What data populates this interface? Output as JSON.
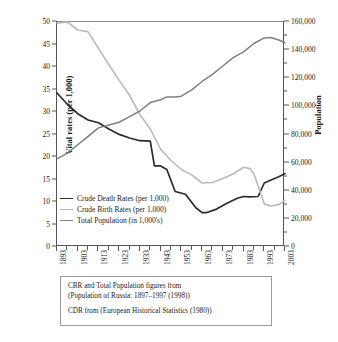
{
  "title": "",
  "chart_data": {
    "type": "line",
    "title": "",
    "xlabel": "",
    "ylabel": "Vital rates (per 1,000)",
    "y2label": "Population",
    "xlim": [
      1893,
      2003
    ],
    "ylim": [
      0,
      50
    ],
    "y2lim": [
      0,
      160000
    ],
    "grid": false,
    "legend_position": "bottom-left",
    "xticks": [
      1893,
      1903,
      1913,
      1923,
      1933,
      1943,
      1953,
      1963,
      1973,
      1983,
      1993,
      2003
    ],
    "xtick_labels": [
      "1893",
      "1903",
      "1913",
      "1923",
      "1933",
      "1943",
      "1953",
      "1963",
      "1973",
      "1983",
      "1993",
      "2003"
    ],
    "xminor_step": 5,
    "yticks": [
      0,
      5,
      10,
      15,
      20,
      25,
      30,
      35,
      40,
      45,
      50
    ],
    "ytick_labels": [
      "0",
      "5",
      "10",
      "15",
      "20",
      "25",
      "30",
      "35",
      "40",
      "45",
      "50"
    ],
    "y2ticks": [
      0,
      20000,
      40000,
      60000,
      80000,
      100000,
      120000,
      140000,
      160000
    ],
    "y2tick_labels": [
      "0",
      "20,000",
      "40,000",
      "60,000",
      "80,000",
      "100,000",
      "120,000",
      "140,000",
      "160,000"
    ],
    "series": [
      {
        "name": "Crude Death Rates (per 1,000)",
        "axis": "left",
        "color": "#2b2b2b",
        "width": 1.7,
        "x": [
          1893,
          1898,
          1903,
          1908,
          1913,
          1918,
          1923,
          1928,
          1933,
          1938,
          1940,
          1943,
          1946,
          1950,
          1955,
          1960,
          1963,
          1965,
          1970,
          1975,
          1980,
          1983,
          1986,
          1990,
          1993,
          1996,
          2000,
          2003
        ],
        "y": [
          34.0,
          31.5,
          29.4,
          28.0,
          27.4,
          26.0,
          24.8,
          24.0,
          23.4,
          23.3,
          17.8,
          17.8,
          17.0,
          12.1,
          11.5,
          8.5,
          7.4,
          7.4,
          8.2,
          9.5,
          10.6,
          11.0,
          10.9,
          11.0,
          14.0,
          14.6,
          15.4,
          16.1
        ]
      },
      {
        "name": "Crude Birth Rates (per 1,000)",
        "axis": "left",
        "color": "#b9b9b9",
        "width": 1.6,
        "x": [
          1893,
          1898,
          1903,
          1908,
          1913,
          1918,
          1923,
          1928,
          1933,
          1938,
          1943,
          1948,
          1953,
          1958,
          1963,
          1968,
          1973,
          1978,
          1983,
          1986,
          1988,
          1990,
          1993,
          1996,
          2000,
          2003
        ],
        "y": [
          49.5,
          49.8,
          48.0,
          47.6,
          43.9,
          40.3,
          36.8,
          33.5,
          29.2,
          26.0,
          21.5,
          19.0,
          17.0,
          15.8,
          14.0,
          14.1,
          15.0,
          16.0,
          17.5,
          17.2,
          16.0,
          13.4,
          9.4,
          8.9,
          9.2,
          10.2
        ]
      },
      {
        "name": "Total Population (in 1,000's)",
        "axis": "right",
        "color": "#7f7f7f",
        "width": 1.5,
        "x": [
          1893,
          1898,
          1903,
          1908,
          1913,
          1918,
          1923,
          1928,
          1933,
          1938,
          1943,
          1946,
          1950,
          1953,
          1958,
          1963,
          1968,
          1973,
          1978,
          1983,
          1988,
          1993,
          1996,
          2000,
          2003
        ],
        "y": [
          62000,
          66000,
          72000,
          78000,
          84000,
          86000,
          88000,
          92000,
          96000,
          102000,
          104000,
          106000,
          106000,
          106500,
          111000,
          117000,
          122000,
          128000,
          134000,
          138000,
          144000,
          148000,
          148200,
          146500,
          144500
        ]
      }
    ]
  },
  "legend": {
    "items": [
      {
        "label": "Crude Death Rates (per 1,000)",
        "color": "#2b2b2b"
      },
      {
        "label": "Crude Birth Rates (per 1,000)",
        "color": "#b9b9b9"
      },
      {
        "label": "Total Population (in 1,000's)",
        "color": "#7f7f7f"
      }
    ]
  },
  "caption": {
    "line1": "CBR and Total Population figures from",
    "line2": "(Population of Russia: 1897–1997 (1998))",
    "line3": "CDR from (European Historical Statistics (1980))"
  }
}
